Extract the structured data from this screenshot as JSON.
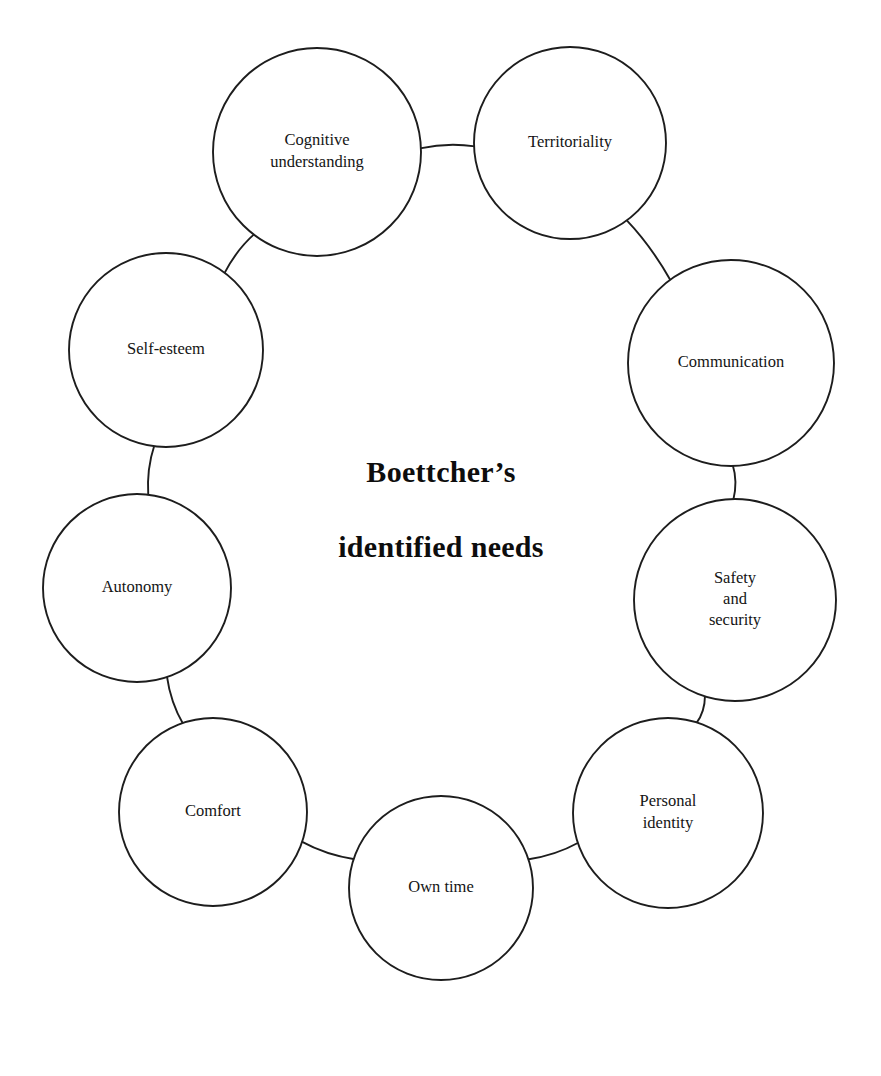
{
  "diagram": {
    "title_line1": "Boettcher’s",
    "title_line2": "identified needs",
    "type": "circular-node-diagram",
    "background_color": "#ffffff",
    "stroke_color": "#1d1d1d",
    "node_count": 10,
    "nodes": [
      {
        "id": "cognitive-understanding",
        "lines": [
          "Cognitive",
          "understanding"
        ],
        "cx": 317,
        "cy": 152,
        "r": 104,
        "label_font_size": 16.5
      },
      {
        "id": "territoriality",
        "lines": [
          "Territoriality"
        ],
        "cx": 570,
        "cy": 143,
        "r": 96,
        "label_font_size": 16.5
      },
      {
        "id": "communication",
        "lines": [
          "Communication"
        ],
        "cx": 731,
        "cy": 363,
        "r": 103,
        "label_font_size": 16.5
      },
      {
        "id": "safety-and-security",
        "lines": [
          "Safety",
          "and",
          "security"
        ],
        "cx": 735,
        "cy": 600,
        "r": 101,
        "label_font_size": 16.5
      },
      {
        "id": "personal-identity",
        "lines": [
          "Personal",
          "identity"
        ],
        "cx": 668,
        "cy": 813,
        "r": 95,
        "label_font_size": 16.5
      },
      {
        "id": "own-time",
        "lines": [
          "Own time"
        ],
        "cx": 441,
        "cy": 888,
        "r": 92,
        "label_font_size": 16.5
      },
      {
        "id": "comfort",
        "lines": [
          "Comfort"
        ],
        "cx": 213,
        "cy": 812,
        "r": 94,
        "label_font_size": 16.5
      },
      {
        "id": "autonomy",
        "lines": [
          "Autonomy"
        ],
        "cx": 137,
        "cy": 588,
        "r": 94,
        "label_font_size": 16.5
      },
      {
        "id": "self-esteem",
        "lines": [
          "Self-esteem"
        ],
        "cx": 166,
        "cy": 350,
        "r": 97,
        "label_font_size": 16.5
      }
    ],
    "extra_node": {
      "id": "self-esteem-duplicate-placeholder",
      "note": ""
    },
    "links": [
      {
        "from": "cognitive-understanding",
        "to": "territoriality"
      },
      {
        "from": "territoriality",
        "to": "communication"
      },
      {
        "from": "communication",
        "to": "safety-and-security"
      },
      {
        "from": "safety-and-security",
        "to": "personal-identity"
      },
      {
        "from": "personal-identity",
        "to": "own-time"
      },
      {
        "from": "own-time",
        "to": "comfort"
      },
      {
        "from": "comfort",
        "to": "autonomy"
      },
      {
        "from": "autonomy",
        "to": "self-esteem"
      },
      {
        "from": "self-esteem",
        "to": "cognitive-understanding"
      }
    ],
    "center": {
      "cx": 441,
      "title_y1": 482,
      "title_y2": 557
    }
  }
}
